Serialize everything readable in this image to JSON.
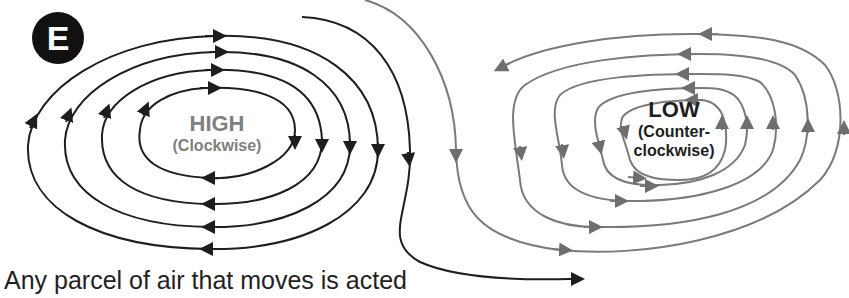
{
  "badge": {
    "letter": "E"
  },
  "high": {
    "title": "HIGH",
    "subtitle": "(Clockwise)",
    "color": "#808080"
  },
  "low": {
    "title": "LOW",
    "subtitle_line1": "(Counter-",
    "subtitle_line2": "clockwise)",
    "color": "#1e1e1e"
  },
  "caption": "Any parcel of air that moves is acted",
  "colors": {
    "high_streamlines": "#1e1e1e",
    "low_streamlines": "#7a7a7a"
  }
}
